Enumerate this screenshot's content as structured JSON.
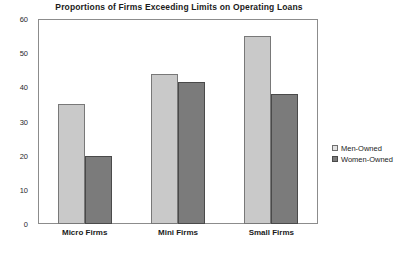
{
  "chart_data": {
    "type": "bar",
    "title": "Proportions of Firms Exceeding Limits on Operating Loans",
    "xlabel": "",
    "ylabel": "",
    "categories": [
      "Micro Firms",
      "Mini Firms",
      "Small Firms"
    ],
    "series": [
      {
        "name": "Men-Owned",
        "color": "#c9c9c9",
        "values": [
          35,
          44,
          55
        ]
      },
      {
        "name": "Women-Owned",
        "color": "#7b7b7b",
        "values": [
          20,
          41.5,
          38
        ]
      }
    ],
    "ylim": [
      0,
      60
    ],
    "y_ticks": [
      0,
      10,
      20,
      30,
      40,
      50,
      60
    ],
    "y_tick_labels": [
      "0",
      "10",
      "20",
      "30",
      "40",
      "50",
      "60"
    ],
    "grid": false,
    "legend_position": "right",
    "legend_entries": [
      "Men-Owned",
      "Women-Owned"
    ]
  },
  "style": {
    "frame_color": "#8c8c8c",
    "text_color": "#1b1b1b",
    "background": "#ffffff"
  }
}
